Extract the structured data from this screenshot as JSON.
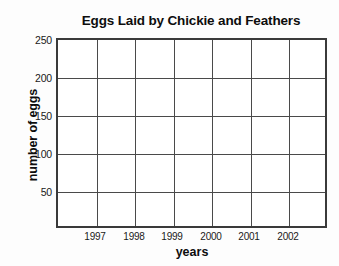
{
  "chart_data": {
    "type": "bar",
    "title": "Eggs Laid by Chickie and Feathers",
    "xlabel": "years",
    "ylabel": "number of eggs",
    "categories": [
      "1997",
      "1998",
      "1999",
      "2000",
      "2001",
      "2002",
      ""
    ],
    "values": [
      null,
      null,
      null,
      null,
      null,
      null,
      null
    ],
    "series": [],
    "ylim": [
      0,
      250
    ],
    "ytick_values": [
      50,
      100,
      150,
      200,
      250
    ],
    "ytick_labels": [
      "50",
      "100",
      "150",
      "200",
      "250"
    ],
    "grid": "both",
    "legend": "none",
    "note": "Empty grid template — no bars or data plotted",
    "colors": {
      "background": "#fdfdfd",
      "plot_background": "#ffffff",
      "frame": "#3a3a3a",
      "gridline": "#4a4a4a",
      "text": "#111111"
    }
  },
  "axes": {
    "y_ticks": [
      {
        "label": "250",
        "top": 34
      },
      {
        "label": "200",
        "top": 72
      },
      {
        "label": "150",
        "top": 110
      },
      {
        "label": "100",
        "top": 148
      },
      {
        "label": "50",
        "top": 186
      }
    ],
    "x_ticks": [
      {
        "label": "1997",
        "left": 75
      },
      {
        "label": "1998",
        "left": 114
      },
      {
        "label": "1999",
        "left": 152
      },
      {
        "label": "2000",
        "left": 191
      },
      {
        "label": "2001",
        "left": 229
      },
      {
        "label": "2002",
        "left": 268
      }
    ],
    "horizontal_gridlines": [
      38,
      76,
      114,
      152
    ],
    "vertical_gridlines": [
      38.5,
      77,
      115.5,
      154,
      192.5,
      231
    ]
  }
}
